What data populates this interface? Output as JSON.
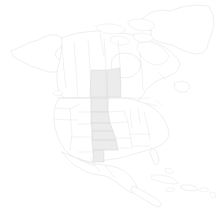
{
  "figure": {
    "kind": "choropleth-map",
    "width": 220,
    "height": 219,
    "background_color": "#ffffff",
    "title": "",
    "subtitle": "",
    "legend_visible": false,
    "legend_text": "",
    "axis_labels_visible": false,
    "annotations": []
  },
  "style": {
    "outline_color": "#dcdcdc",
    "subdivision_color": "#dedede",
    "land_fill": "#ffffff",
    "highlight_fill": "#ececec",
    "highlight_stroke": "#d6d6d6"
  },
  "chart_data": {
    "type": "map",
    "projection_extent": "North America",
    "title": "",
    "xlabel": "",
    "ylabel": "",
    "legend": [],
    "categories": [
      "Saskatchewan",
      "Manitoba",
      "North Dakota",
      "South Dakota",
      "Nebraska",
      "Kansas",
      "Oklahoma",
      "Texas Panhandle"
    ],
    "values": [
      1,
      1,
      1,
      1,
      1,
      1,
      1,
      1
    ],
    "highlight_band": "Great Plains corridor",
    "unhighlighted_regions": [
      "Alaska",
      "Yukon",
      "British Columbia",
      "Alberta",
      "Ontario",
      "Quebec",
      "Greenland",
      "Mexico",
      "Central America",
      "Caribbean islands",
      "Eastern United States",
      "Western United States"
    ]
  },
  "map": {
    "landmasses": [
      {
        "name": "greenland",
        "label": "Greenland",
        "highlighted": false,
        "path": "M208 6 L196 5 L182 7 L170 11 L160 10 L150 13 L143 18 L140 24 L144 29 L152 31 L150 36 L155 40 L163 43 L172 45 L180 49 L188 52 L196 54 L203 53 L207 48 L209 41 L212 33 L214 24 L213 15 Z"
      },
      {
        "name": "alaska",
        "label": "Alaska",
        "highlighted": false,
        "path": "M11 51 L18 48 L24 45 L31 42 L38 40 L44 37 L50 35 L57 35 L62 38 L64 43 L61 47 L57 50 L55 55 L58 59 L62 61 L63 66 L60 70 L55 72 L49 72 L43 70 L37 68 L31 66 L25 63 L19 60 L14 57 Z"
      },
      {
        "name": "canada-mainland",
        "label": "Canada",
        "highlighted": false,
        "path": "M62 38 L70 35 L78 33 L86 32 L95 31 L104 31 L112 32 L120 33 L129 34 L137 36 L145 38 L152 41 L159 44 L166 48 L172 53 L177 58 L180 64 L178 70 L173 74 L167 77 L161 79 L155 82 L150 86 L146 90 L143 95 L140 99 L136 101 L130 100 L124 99 L118 98 L112 98 L106 98 L100 98 L94 98 L88 98 L82 98 L76 98 L70 98 L64 98 L60 94 L58 88 L57 81 L57 74 L58 67 L60 60 L61 52 L62 45 Z"
      },
      {
        "name": "arctic-archipelago-a",
        "label": "Arctic island",
        "highlighted": false,
        "path": "M96 26 L104 24 L113 24 L121 26 L126 30 L122 33 L114 34 L105 33 L98 30 Z"
      },
      {
        "name": "arctic-archipelago-b",
        "label": "Arctic island",
        "highlighted": false,
        "path": "M128 21 L136 19 L145 19 L152 22 L155 27 L150 30 L142 31 L134 29 L129 25 Z"
      },
      {
        "name": "arctic-archipelago-c",
        "label": "Arctic island",
        "highlighted": false,
        "path": "M111 37 L119 36 L127 38 L130 42 L125 45 L117 45 L111 42 Z"
      },
      {
        "name": "arctic-archipelago-d",
        "label": "Arctic island",
        "highlighted": false,
        "path": "M134 34 L143 33 L151 35 L154 39 L148 42 L140 42 L134 39 Z"
      },
      {
        "name": "baffin-island",
        "label": "Baffin Island",
        "highlighted": false,
        "path": "M139 43 L149 42 L158 45 L165 50 L169 56 L166 62 L159 65 L151 64 L145 60 L140 55 L137 49 Z"
      },
      {
        "name": "hudson-bay-shore",
        "label": "Hudson Bay",
        "highlighted": false,
        "path": "M116 55 L124 53 L132 54 L138 58 L141 64 L139 71 L133 76 L126 78 L119 77 L114 73 L111 67 L112 60 Z"
      },
      {
        "name": "newfoundland",
        "label": "Newfoundland",
        "highlighted": false,
        "path": "M175 83 L182 81 L188 83 L190 88 L186 92 L179 92 L175 88 Z"
      },
      {
        "name": "united-states-mainland",
        "label": "United States",
        "highlighted": false,
        "path": "M60 98 L68 98 L76 98 L84 98 L92 98 L100 98 L108 98 L116 98 L124 98 L132 99 L138 101 L144 103 L150 106 L156 110 L161 115 L165 121 L168 128 L169 135 L166 141 L161 145 L155 148 L148 150 L141 152 L134 154 L127 156 L120 158 L113 159 L106 160 L99 161 L92 162 L86 161 L80 159 L74 157 L69 154 L65 150 L62 145 L59 140 L57 134 L55 128 L54 121 L54 114 L55 107 L57 102 Z"
      },
      {
        "name": "mexico",
        "label": "Mexico",
        "highlighted": false,
        "path": "M62 152 L69 155 L76 158 L83 161 L90 163 L97 164 L104 165 L111 166 L118 168 L124 171 L129 175 L133 180 L136 185 L138 190 L135 193 L130 192 L125 189 L120 185 L115 181 L110 178 L105 176 L99 175 L93 174 L87 172 L81 169 L76 166 L71 162 L67 158 Z"
      },
      {
        "name": "central-america",
        "label": "Central America",
        "highlighted": false,
        "path": "M133 186 L139 189 L145 192 L150 195 L155 198 L159 201 L162 204 L160 207 L155 206 L150 203 L145 200 L140 197 L135 194 L131 190 Z"
      },
      {
        "name": "florida-peninsula",
        "label": "Florida",
        "highlighted": false,
        "path": "M152 148 L156 151 L158 156 L159 161 L157 165 L154 163 L152 158 L150 153 Z"
      },
      {
        "name": "cuba",
        "label": "Cuba",
        "highlighted": false,
        "path": "M152 175 L161 175 L170 177 L176 180 L179 183 L174 184 L166 183 L158 181 L152 179 Z"
      },
      {
        "name": "hispaniola",
        "label": "Hispaniola",
        "highlighted": false,
        "path": "M182 185 L190 185 L196 187 L198 190 L192 191 L185 190 L181 188 Z"
      },
      {
        "name": "jamaica",
        "label": "Jamaica",
        "highlighted": false,
        "path": "M167 188 L173 188 L175 190 L171 192 L166 191 Z"
      },
      {
        "name": "puerto-rico",
        "label": "Puerto Rico",
        "highlighted": false,
        "path": "M201 188 L207 188 L209 190 L204 192 L200 191 Z"
      },
      {
        "name": "bahamas",
        "label": "Bahamas",
        "highlighted": false,
        "path": "M166 168 L171 169 L174 172 L170 174 L166 172 Z"
      },
      {
        "name": "lesser-antilles",
        "label": "Lesser Antilles",
        "highlighted": false,
        "path": "M211 192 L215 193 L216 197 L212 198 L210 195 Z"
      },
      {
        "name": "vancouver-island",
        "label": "Vancouver Island",
        "highlighted": false,
        "path": "M54 92 L60 90 L63 93 L59 96 L54 95 Z"
      }
    ],
    "subdivision_lines": [
      {
        "name": "canada-us-border",
        "path": "M57 98 L150 98"
      },
      {
        "name": "yukon-bc-line",
        "path": "M62 45 L64 70 L66 88"
      },
      {
        "name": "bc-alberta-line",
        "path": "M74 42 L76 70 L78 97"
      },
      {
        "name": "alberta-sask-line",
        "path": "M88 40 L90 68 L91 97"
      },
      {
        "name": "sask-manitoba-line",
        "path": "M104 39 L106 68 L108 97"
      },
      {
        "name": "manitoba-ontario-line",
        "path": "M118 40 L120 65 L121 88"
      },
      {
        "name": "ontario-quebec-line",
        "path": "M140 52 L142 72 L143 90"
      },
      {
        "name": "quebec-maritimes-line",
        "path": "M158 72 L166 80"
      },
      {
        "name": "nunavut-line",
        "path": "M100 33 L104 56"
      },
      {
        "name": "us-wa-or-line",
        "path": "M56 108 L70 109"
      },
      {
        "name": "us-or-ca-line",
        "path": "M55 119 L70 120"
      },
      {
        "name": "us-ca-east-line",
        "path": "M70 109 L72 135 L70 150"
      },
      {
        "name": "us-id-mt-line",
        "path": "M70 109 L80 104"
      },
      {
        "name": "us-mt-south-line",
        "path": "M78 112 L91 112"
      },
      {
        "name": "us-wy-south-line",
        "path": "M78 124 L92 124"
      },
      {
        "name": "us-co-south-line",
        "path": "M78 137 L93 137"
      },
      {
        "name": "us-nm-south-line",
        "path": "M78 152 L93 152"
      },
      {
        "name": "us-id-ut-nv-line",
        "path": "M70 120 L78 120"
      },
      {
        "name": "us-ut-az-line",
        "path": "M71 137 L78 137"
      },
      {
        "name": "us-nd-sd-line",
        "path": "M91 112 L108 112"
      },
      {
        "name": "us-sd-ne-line",
        "path": "M91 123 L110 123"
      },
      {
        "name": "us-ne-ks-line",
        "path": "M92 131 L113 131"
      },
      {
        "name": "us-ks-ok-line",
        "path": "M92 140 L116 140"
      },
      {
        "name": "us-ok-tx-line",
        "path": "M93 150 L118 150"
      },
      {
        "name": "us-plains-west-line",
        "path": "M91 98 L91 112 L92 124 L92 140 L93 152"
      },
      {
        "name": "us-plains-east-line",
        "path": "M108 98 L108 112 L110 123 L113 131 L116 140 L118 150"
      },
      {
        "name": "us-mn-ia-line",
        "path": "M108 112 L124 111"
      },
      {
        "name": "us-ia-mo-line",
        "path": "M110 123 L128 122"
      },
      {
        "name": "us-mo-ar-line",
        "path": "M116 138 L132 138"
      },
      {
        "name": "us-ar-la-line",
        "path": "M118 148 L132 148"
      },
      {
        "name": "us-midwest-east-line",
        "path": "M124 111 L128 122 L130 134 L132 146"
      },
      {
        "name": "us-il-in-line",
        "path": "M130 110 L132 128"
      },
      {
        "name": "us-oh-line",
        "path": "M138 108 L140 124"
      },
      {
        "name": "us-appalachian-line",
        "path": "M144 112 L148 128 L150 140"
      },
      {
        "name": "us-ny-pa-line",
        "path": "M146 103 L156 106"
      },
      {
        "name": "us-ne-states-line",
        "path": "M156 100 L162 105"
      },
      {
        "name": "us-tn-line",
        "path": "M130 134 L150 134"
      },
      {
        "name": "us-gulf-line",
        "path": "M132 146 L150 146"
      },
      {
        "name": "mexico-state-line-a",
        "path": "M80 160 L95 166"
      },
      {
        "name": "mexico-state-line-b",
        "path": "M90 158 L100 172"
      },
      {
        "name": "mexico-state-line-c",
        "path": "M105 166 L115 178"
      }
    ],
    "highlighted_regions": [
      {
        "name": "saskatchewan",
        "label": "Saskatchewan",
        "fill": "#ececec",
        "path": "M91 70 L106 70 L107 97 L90 97 Z"
      },
      {
        "name": "manitoba",
        "label": "Manitoba",
        "fill": "#ececec",
        "path": "M107 70 L120 68 L121 97 L107 97 Z"
      },
      {
        "name": "north-dakota",
        "label": "North Dakota",
        "fill": "#ececec",
        "path": "M91 98 L108 98 L108 112 L91 112 Z"
      },
      {
        "name": "south-dakota",
        "label": "South Dakota",
        "fill": "#ececec",
        "path": "M91 112 L108 112 L110 123 L91 123 Z"
      },
      {
        "name": "nebraska",
        "label": "Nebraska",
        "fill": "#ececec",
        "path": "M91 123 L110 123 L113 131 L92 131 Z"
      },
      {
        "name": "kansas",
        "label": "Kansas",
        "fill": "#ececec",
        "path": "M92 131 L113 131 L116 140 L92 140 Z"
      },
      {
        "name": "oklahoma",
        "label": "Oklahoma",
        "fill": "#ececec",
        "path": "M92 140 L116 140 L118 150 L93 150 Z"
      },
      {
        "name": "texas-panhandle",
        "label": "Texas Panhandle",
        "fill": "#ececec",
        "path": "M93 150 L104 150 L104 162 L93 162 Z"
      }
    ]
  }
}
